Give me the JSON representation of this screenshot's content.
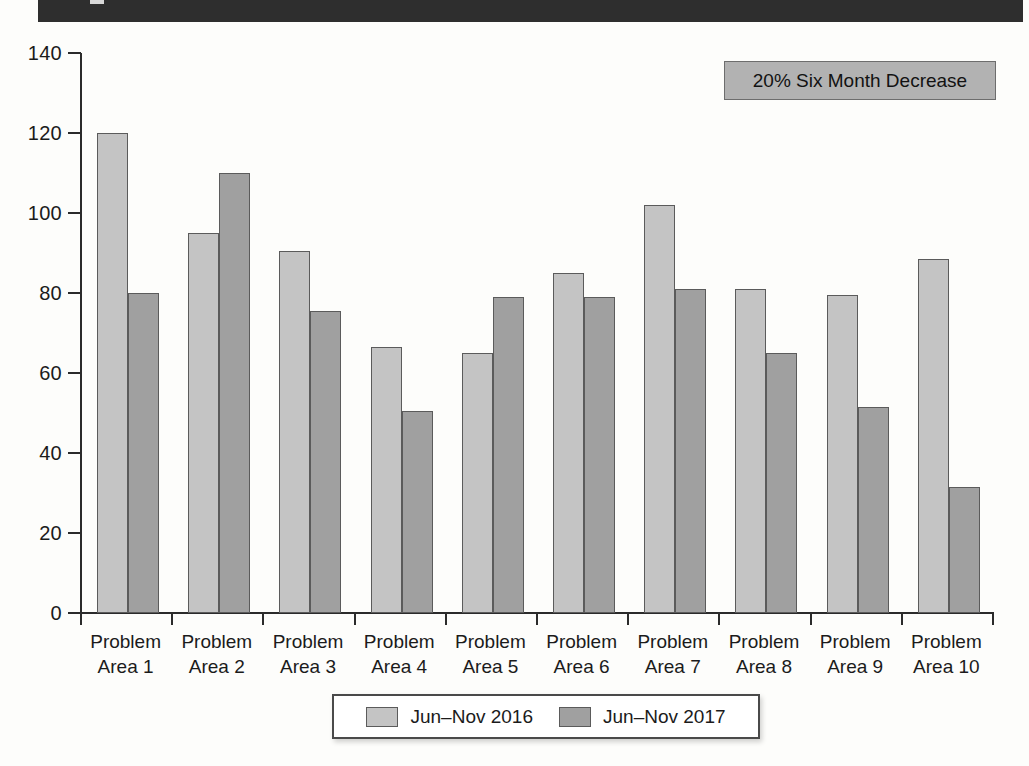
{
  "header": {
    "band_color": "#2e2e2e"
  },
  "annotation": {
    "text": "20% Six Month Decrease",
    "fill": "#b2b2b2"
  },
  "legend": {
    "entries": [
      {
        "label": "Jun–Nov 2016",
        "color": "#c4c4c4"
      },
      {
        "label": "Jun–Nov 2017",
        "color": "#a0a0a0"
      }
    ]
  },
  "chart_data": {
    "type": "bar",
    "title": "",
    "xlabel": "",
    "ylabel": "",
    "ylim": [
      0,
      140
    ],
    "yticks": [
      0,
      20,
      40,
      60,
      80,
      100,
      120,
      140
    ],
    "ytick_labels": [
      "0",
      "20",
      "40",
      "60",
      "80",
      "100",
      "120",
      "140"
    ],
    "grid": false,
    "legend_position": "bottom",
    "categories": [
      "Problem\nArea 1",
      "Problem\nArea 2",
      "Problem\nArea 3",
      "Problem\nArea 4",
      "Problem\nArea 5",
      "Problem\nArea 6",
      "Problem\nArea 7",
      "Problem\nArea 8",
      "Problem\nArea 9",
      "Problem\nArea 10"
    ],
    "category_lines": [
      [
        "Problem",
        "Area 1"
      ],
      [
        "Problem",
        "Area 2"
      ],
      [
        "Problem",
        "Area 3"
      ],
      [
        "Problem",
        "Area 4"
      ],
      [
        "Problem",
        "Area 5"
      ],
      [
        "Problem",
        "Area 6"
      ],
      [
        "Problem",
        "Area 7"
      ],
      [
        "Problem",
        "Area 8"
      ],
      [
        "Problem",
        "Area 9"
      ],
      [
        "Problem",
        "Area 10"
      ]
    ],
    "series": [
      {
        "name": "Jun–Nov 2016",
        "color": "#c4c4c4",
        "values": [
          120,
          95,
          90.5,
          66.5,
          65,
          85,
          102,
          81,
          79.5,
          88.5
        ]
      },
      {
        "name": "Jun–Nov 2017",
        "color": "#a0a0a0",
        "values": [
          80,
          110,
          75.5,
          50.5,
          79,
          79,
          81,
          65,
          51.5,
          31.5
        ]
      }
    ],
    "annotations": [
      "20% Six Month Decrease"
    ]
  }
}
